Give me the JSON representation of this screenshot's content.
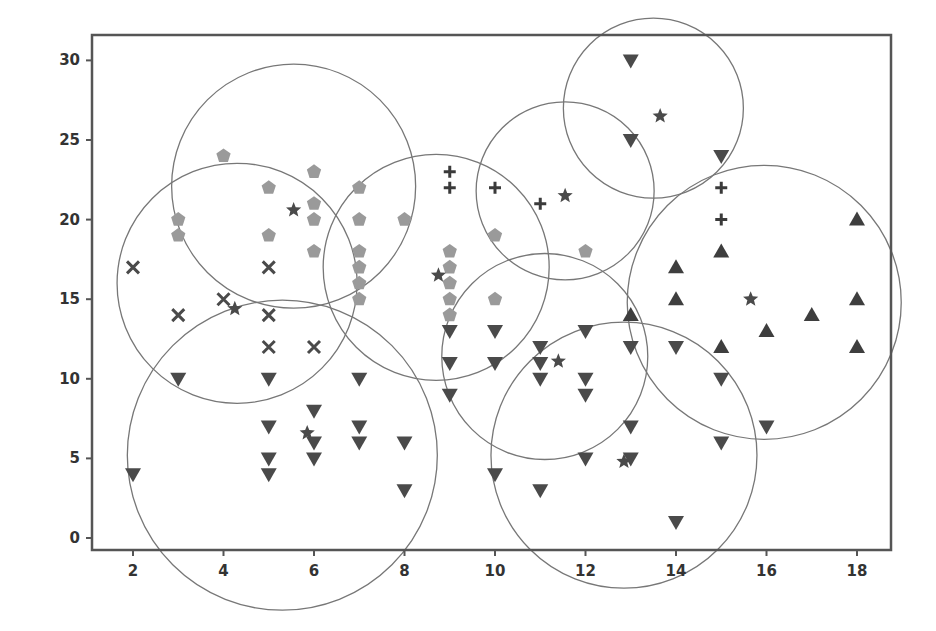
{
  "chart_data": {
    "type": "scatter",
    "title": "",
    "xlabel": "",
    "ylabel": "",
    "xlim": [
      1.0,
      18.8
    ],
    "ylim": [
      -0.8,
      32.3
    ],
    "x_ticks": [
      2,
      4,
      6,
      8,
      10,
      12,
      14,
      16,
      18
    ],
    "y_ticks": [
      0,
      5,
      10,
      15,
      20,
      25,
      30
    ],
    "grid": false,
    "legend": null,
    "colors": {
      "frame": "#555555",
      "circle": "#777777",
      "dark_marker": "#4a4a4a",
      "light_marker": "#9a9a9a"
    },
    "series": [
      {
        "name": "cluster-x",
        "marker": "x",
        "color": "#4a4a4a",
        "points": [
          [
            2,
            17
          ],
          [
            3,
            14
          ],
          [
            4,
            15
          ],
          [
            5,
            17
          ],
          [
            5,
            14
          ],
          [
            5,
            12
          ],
          [
            6,
            12
          ]
        ]
      },
      {
        "name": "cluster-pentagon",
        "marker": "pentagon",
        "color": "#9a9a9a",
        "points": [
          [
            3,
            20
          ],
          [
            3,
            19
          ],
          [
            4,
            24
          ],
          [
            5,
            22
          ],
          [
            5,
            19
          ],
          [
            6,
            23
          ],
          [
            6,
            21
          ],
          [
            6,
            20
          ],
          [
            6,
            18
          ],
          [
            7,
            22
          ],
          [
            7,
            20
          ],
          [
            7,
            18
          ],
          [
            7,
            17
          ],
          [
            7,
            16
          ],
          [
            7,
            15
          ],
          [
            8,
            20
          ],
          [
            9,
            18
          ],
          [
            9,
            17
          ],
          [
            9,
            16
          ],
          [
            9,
            15
          ],
          [
            9,
            14
          ],
          [
            10,
            19
          ],
          [
            10,
            15
          ],
          [
            12,
            18
          ]
        ]
      },
      {
        "name": "cluster-plus",
        "marker": "plus",
        "color": "#3a3a3a",
        "points": [
          [
            9,
            23
          ],
          [
            9,
            22
          ],
          [
            10,
            22
          ],
          [
            11,
            21
          ],
          [
            15,
            22
          ],
          [
            15,
            20
          ]
        ]
      },
      {
        "name": "cluster-triangle-up",
        "marker": "triangle-up",
        "color": "#3e3e3e",
        "points": [
          [
            13,
            14
          ],
          [
            14,
            17
          ],
          [
            14,
            15
          ],
          [
            15,
            18
          ],
          [
            15,
            12
          ],
          [
            16,
            13
          ],
          [
            17,
            14
          ],
          [
            18,
            20
          ],
          [
            18,
            15
          ],
          [
            18,
            12
          ]
        ]
      },
      {
        "name": "cluster-triangle-down",
        "marker": "triangle-down",
        "color": "#4a4a4a",
        "points": [
          [
            2,
            4
          ],
          [
            3,
            10
          ],
          [
            5,
            10
          ],
          [
            5,
            7
          ],
          [
            5,
            5
          ],
          [
            5,
            4
          ],
          [
            6,
            8
          ],
          [
            6,
            6
          ],
          [
            6,
            5
          ],
          [
            7,
            10
          ],
          [
            7,
            7
          ],
          [
            7,
            6
          ],
          [
            8,
            6
          ],
          [
            8,
            3
          ],
          [
            9,
            13
          ],
          [
            9,
            11
          ],
          [
            9,
            9
          ],
          [
            10,
            13
          ],
          [
            10,
            11
          ],
          [
            10,
            4
          ],
          [
            11,
            12
          ],
          [
            11,
            11
          ],
          [
            11,
            10
          ],
          [
            11,
            3
          ],
          [
            12,
            13
          ],
          [
            12,
            10
          ],
          [
            12,
            9
          ],
          [
            12,
            5
          ],
          [
            13,
            30
          ],
          [
            13,
            25
          ],
          [
            13,
            12
          ],
          [
            13,
            7
          ],
          [
            13,
            5
          ],
          [
            14,
            12
          ],
          [
            14,
            1
          ],
          [
            15,
            24
          ],
          [
            15,
            10
          ],
          [
            15,
            6
          ],
          [
            16,
            7
          ]
        ]
      },
      {
        "name": "centroids-star",
        "marker": "star",
        "color": "#4a4a4a",
        "points": [
          [
            5.55,
            20.6
          ],
          [
            4.25,
            14.4
          ],
          [
            8.75,
            16.5
          ],
          [
            11.55,
            21.5
          ],
          [
            13.65,
            26.5
          ],
          [
            15.65,
            15.0
          ],
          [
            11.4,
            11.1
          ],
          [
            5.85,
            6.6
          ],
          [
            12.85,
            4.8
          ]
        ]
      }
    ],
    "circles": [
      {
        "cx": 5.55,
        "cy": 22.1,
        "r_px": 122
      },
      {
        "cx": 4.3,
        "cy": 16.0,
        "r_px": 120
      },
      {
        "cx": 8.7,
        "cy": 17.0,
        "r_px": 113
      },
      {
        "cx": 11.55,
        "cy": 21.8,
        "r_px": 89
      },
      {
        "cx": 13.5,
        "cy": 27.0,
        "r_px": 90
      },
      {
        "cx": 15.95,
        "cy": 14.8,
        "r_px": 137
      },
      {
        "cx": 11.1,
        "cy": 11.4,
        "r_px": 103
      },
      {
        "cx": 5.3,
        "cy": 5.2,
        "r_px": 155
      },
      {
        "cx": 12.85,
        "cy": 5.2,
        "r_px": 133
      }
    ]
  }
}
